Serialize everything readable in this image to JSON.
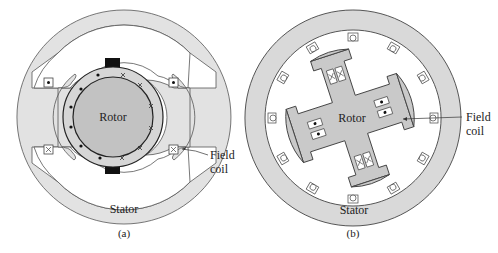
{
  "figure_a": {
    "caption": "(a)",
    "rotor_label": "Rotor",
    "stator_label": "Stator",
    "field_coil_label_line1": "Field",
    "field_coil_label_line2": "coil"
  },
  "figure_b": {
    "caption": "(b)",
    "rotor_label": "Rotor",
    "stator_label": "Stator",
    "field_coil_label_line1": "Field",
    "field_coil_label_line2": "coil"
  },
  "colors": {
    "stator_fill": "#e2e2e2",
    "rotor_fill": "#c4c4c4",
    "ring_fill": "#d0d0d0",
    "outline": "#444444",
    "brush": "#111111"
  }
}
